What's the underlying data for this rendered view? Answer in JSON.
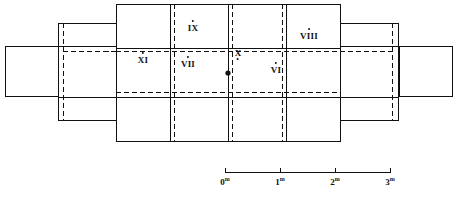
{
  "figure": {
    "kind": "archaeological-site-plan",
    "line_color": "#111111",
    "background_color": "#ffffff",
    "center_marker": {
      "name": "center-point",
      "x": 228,
      "y": 73
    }
  },
  "rooms": [
    {
      "id": "IX",
      "label": "IX",
      "x": 193,
      "y": 26,
      "dot_x": 193,
      "dot_y": 20
    },
    {
      "id": "X",
      "label": "X",
      "x": 238,
      "y": 37,
      "dot_x": 238,
      "dot_y": 49
    },
    {
      "id": "VIII",
      "label": "VIII",
      "x": 309,
      "y": 34,
      "dot_x": 309,
      "dot_y": 28
    },
    {
      "id": "XI",
      "label": "XI",
      "x": 143,
      "y": 58,
      "dot_x": 143,
      "dot_y": 52
    },
    {
      "id": "VII",
      "label": "VII",
      "x": 188,
      "y": 62,
      "dot_x": 188,
      "dot_y": 56
    },
    {
      "id": "VI",
      "label": "VI",
      "x": 276,
      "y": 69,
      "dot_x": 276,
      "dot_y": 62
    }
  ],
  "scale_bar": {
    "name": "scale-bar",
    "unit": "m",
    "axis_y": 172,
    "x_start": 225,
    "x_end": 390,
    "ticks": [
      {
        "label": "0",
        "unit": "m",
        "x": 225
      },
      {
        "label": "1",
        "unit": "m",
        "x": 280
      },
      {
        "label": "2",
        "unit": "m",
        "x": 335
      },
      {
        "label": "3",
        "unit": "m",
        "x": 390
      }
    ],
    "tick_label_y": 176
  },
  "geometry": {
    "main_block": {
      "x": 116,
      "y": 4,
      "w": 224,
      "h": 137
    },
    "left_wing": {
      "x": 58,
      "y": 23,
      "w": 58,
      "h": 97
    },
    "right_wing": {
      "x": 340,
      "y": 23,
      "w": 58,
      "h": 97
    },
    "left_annex": {
      "x": 5,
      "y": 46,
      "w": 53,
      "h": 50
    },
    "right_annex": {
      "x": 399,
      "y": 46,
      "w": 53,
      "h": 50
    },
    "solid_verticals": [
      170,
      228,
      286
    ],
    "dashed_verticals": [
      174,
      232,
      282
    ],
    "solid_horizontals": [
      48,
      97
    ],
    "dashed_horizontals": [
      51,
      92
    ]
  }
}
